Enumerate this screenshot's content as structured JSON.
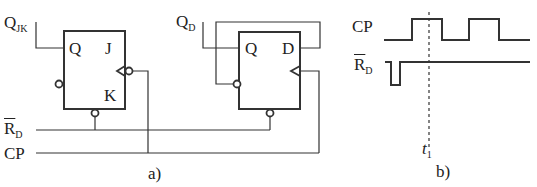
{
  "figure_a": {
    "caption": "a)",
    "jk_flipflop": {
      "output_label_main": "Q",
      "output_label_sub": "JK",
      "pin_q": "Q",
      "pin_j": "J",
      "pin_k": "K"
    },
    "d_flipflop": {
      "output_label_main": "Q",
      "output_label_sub": "D",
      "pin_q": "Q",
      "pin_d": "D"
    },
    "signals": {
      "reset_main": "R",
      "reset_sub": "D",
      "clock": "CP"
    }
  },
  "figure_b": {
    "caption": "b)",
    "waveforms": {
      "clock_label": "CP",
      "reset_main": "R",
      "reset_sub": "D"
    },
    "marker_main": "t",
    "marker_sub": "1"
  },
  "colors": {
    "line": "#333333",
    "background": "#ffffff"
  }
}
